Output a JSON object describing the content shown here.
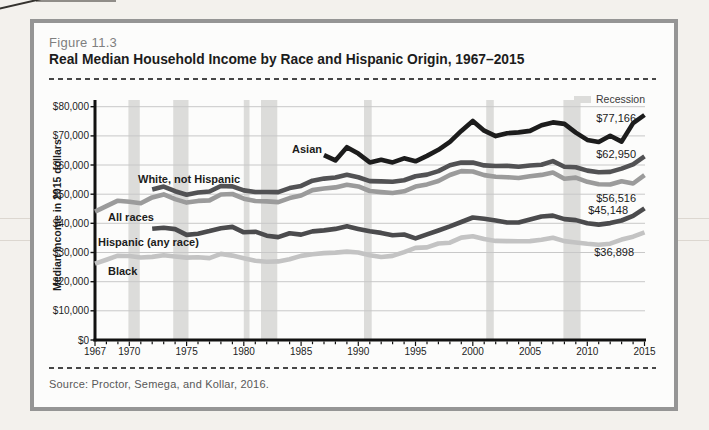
{
  "page": {
    "background": "#f3f1ed",
    "card_border": "#959595",
    "card_background": "#fcfcfb"
  },
  "header": {
    "figure_label": "Figure 11.3",
    "title": "Real Median Household Income by Race and Hispanic Origin, 1967–2015"
  },
  "legend": {
    "label": "Recession",
    "swatch_color": "#dcdcda"
  },
  "source": {
    "text": "Source: Proctor, Semega, and Kollar, 2016."
  },
  "chart_data": {
    "type": "line",
    "title": "Real Median Household Income by Race and Hispanic Origin, 1967–2015",
    "xlabel": "",
    "ylabel": "Median income in 2015 dollars",
    "xlim": [
      1967,
      2015
    ],
    "ylim": [
      0,
      80000
    ],
    "grid": "horizontal",
    "grid_color": "#c8c8c8",
    "axis_color": "#111111",
    "legend_position": "top-right",
    "x_ticks": [
      1967,
      1970,
      1975,
      1980,
      1985,
      1990,
      1995,
      2000,
      2005,
      2010,
      2015
    ],
    "y_ticks": [
      {
        "value": 0,
        "label": "$0"
      },
      {
        "value": 10000,
        "label": "$10,000"
      },
      {
        "value": 20000,
        "label": "$20,000"
      },
      {
        "value": 30000,
        "label": "$30,000"
      },
      {
        "value": 40000,
        "label": "$40,000"
      },
      {
        "value": 50000,
        "label": "$50,000"
      },
      {
        "value": 60000,
        "label": "$60,000"
      },
      {
        "value": 70000,
        "label": "$70,000"
      },
      {
        "value": 80000,
        "label": "$80,000"
      }
    ],
    "recession_color": "#dcdcda",
    "recession_bands": [
      [
        1969.92,
        1970.92
      ],
      [
        1973.83,
        1975.17
      ],
      [
        1980.0,
        1980.5
      ],
      [
        1981.5,
        1982.92
      ],
      [
        1990.5,
        1991.17
      ],
      [
        2001.17,
        2001.83
      ],
      [
        2007.92,
        2009.42
      ]
    ],
    "series": [
      {
        "id": "black",
        "name": "Black",
        "color": "#c3c3c3",
        "start_year": 1967,
        "values": [
          26207,
          27519,
          28895,
          28820,
          28303,
          28507,
          29085,
          28641,
          28264,
          28356,
          28087,
          29534,
          28931,
          28028,
          27156,
          26850,
          26950,
          27705,
          28845,
          29397,
          29785,
          29982,
          30317,
          30014,
          29058,
          28475,
          28840,
          30126,
          31577,
          31746,
          33091,
          33373,
          35118,
          35547,
          34611,
          33965,
          33923,
          33841,
          33897,
          34361,
          35087,
          33926,
          33433,
          32993,
          32671,
          33022,
          34428,
          35439,
          36898
        ],
        "label": {
          "px": [
            108,
            275
          ],
          "anchor": "start"
        },
        "end_label": {
          "text": "$36,898",
          "px": [
            634,
            256
          ]
        }
      },
      {
        "id": "all_races",
        "name": "All races",
        "color": "#9b9b9b",
        "start_year": 1967,
        "values": [
          44013,
          45919,
          47782,
          47398,
          46873,
          48910,
          49919,
          48331,
          47126,
          47704,
          47862,
          49885,
          50067,
          48462,
          47681,
          47541,
          47282,
          48664,
          49541,
          51388,
          51944,
          52312,
          53267,
          52684,
          51094,
          50725,
          50421,
          50990,
          52604,
          53345,
          54512,
          56565,
          57909,
          57790,
          56531,
          55993,
          55832,
          55565,
          56160,
          56598,
          57423,
          55313,
          55683,
          54245,
          53401,
          53331,
          54462,
          53657,
          56516
        ],
        "label": {
          "px": [
            108,
            221
          ],
          "anchor": "start"
        },
        "end_label": {
          "text": "$56,516",
          "px": [
            636,
            202
          ]
        }
      },
      {
        "id": "hispanic",
        "name": "Hispanic (any race)",
        "color": "#4b4b4d",
        "start_year": 1972,
        "values": [
          38144,
          38500,
          38024,
          36024,
          36443,
          37336,
          38351,
          38783,
          36919,
          37142,
          35755,
          35290,
          36605,
          36145,
          37246,
          37580,
          38089,
          38979,
          38085,
          37261,
          36714,
          35926,
          36162,
          34851,
          36243,
          37544,
          38958,
          40454,
          41994,
          41609,
          40982,
          40306,
          40293,
          41280,
          42357,
          42665,
          41470,
          41113,
          40040,
          39576,
          40096,
          40963,
          42540,
          45148
        ],
        "label": {
          "px": [
            98,
            246
          ],
          "anchor": "start"
        },
        "end_label": {
          "text": "$45,148",
          "px": [
            628,
            214
          ]
        }
      },
      {
        "id": "white_not_hispanic",
        "name": "White, not Hispanic",
        "color": "#525254",
        "start_year": 1972,
        "values": [
          51588,
          52612,
          51033,
          49833,
          50585,
          50905,
          52818,
          52666,
          51289,
          50741,
          50749,
          50717,
          52096,
          52849,
          54616,
          55342,
          55706,
          56631,
          55810,
          54473,
          54379,
          54240,
          54811,
          56117,
          56726,
          57931,
          59920,
          60848,
          60875,
          59881,
          59652,
          59718,
          59379,
          59824,
          60117,
          61349,
          59410,
          59244,
          58087,
          57528,
          57646,
          58790,
          60256,
          62950
        ],
        "label": {
          "px": [
            138,
            183
          ],
          "anchor": "start"
        },
        "end_label": {
          "text": "$62,950",
          "px": [
            636,
            158
          ]
        }
      },
      {
        "id": "asian",
        "name": "Asian",
        "color": "#1c1c1c",
        "start_year": 1987,
        "values": [
          63416,
          61576,
          66103,
          63906,
          60892,
          61818,
          60898,
          62290,
          61280,
          63115,
          65211,
          67962,
          71705,
          75115,
          71774,
          69907,
          70913,
          71201,
          71711,
          73609,
          74612,
          74119,
          71109,
          68613,
          67885,
          70071,
          68021,
          74382,
          77166
        ],
        "label": {
          "px": [
            322,
            153
          ],
          "anchor": "end"
        },
        "end_label": {
          "text": "$77,166",
          "px": [
            636,
            122
          ]
        }
      }
    ]
  }
}
